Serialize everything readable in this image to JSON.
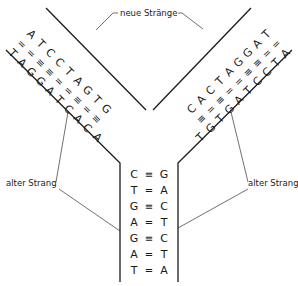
{
  "labels": {
    "new_strands": "neue Stränge",
    "old_strand_left": "alter Strang",
    "old_strand_right": "alter Strang"
  },
  "bond_symbols": {
    "double": "=",
    "triple": "≡"
  },
  "left_arm": {
    "pairs": [
      {
        "old": "T",
        "bond": "=",
        "new": "A"
      },
      {
        "old": "A",
        "bond": "=",
        "new": "T"
      },
      {
        "old": "G",
        "bond": "≡",
        "new": "C"
      },
      {
        "old": "G",
        "bond": "≡",
        "new": "C"
      },
      {
        "old": "A",
        "bond": "=",
        "new": "T"
      },
      {
        "old": "T",
        "bond": "=",
        "new": "A"
      },
      {
        "old": "C",
        "bond": "≡",
        "new": "G"
      },
      {
        "old": "A",
        "bond": "=",
        "new": "T"
      },
      {
        "old": "C",
        "bond": "≡",
        "new": "G"
      }
    ],
    "unpaired": "A"
  },
  "right_arm": {
    "pairs": [
      {
        "new": "T",
        "bond": "=",
        "old": "A"
      },
      {
        "new": "A",
        "bond": "=",
        "old": "T"
      },
      {
        "new": "G",
        "bond": "≡",
        "old": "C"
      },
      {
        "new": "G",
        "bond": "≡",
        "old": "C"
      },
      {
        "new": "A",
        "bond": "=",
        "old": "T"
      },
      {
        "new": "T",
        "bond": "=",
        "old": "A"
      },
      {
        "new": "C",
        "bond": "≡",
        "old": "G"
      },
      {
        "new": "A",
        "bond": "=",
        "old": "T"
      },
      {
        "new": "C",
        "bond": "≡",
        "old": "G"
      }
    ],
    "unpaired": "T"
  },
  "stem": {
    "pairs": [
      {
        "left": "C",
        "bond": "≡",
        "right": "G"
      },
      {
        "left": "T",
        "bond": "=",
        "right": "A"
      },
      {
        "left": "G",
        "bond": "≡",
        "right": "C"
      },
      {
        "left": "A",
        "bond": "=",
        "right": "T"
      },
      {
        "left": "G",
        "bond": "≡",
        "right": "C"
      },
      {
        "left": "A",
        "bond": "=",
        "right": "T"
      },
      {
        "left": "T",
        "bond": "=",
        "right": "A"
      }
    ]
  }
}
